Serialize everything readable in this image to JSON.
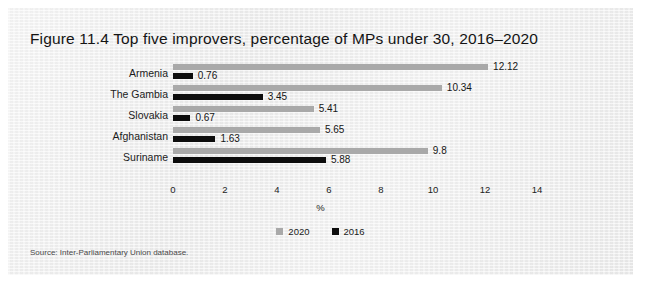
{
  "figure": {
    "title": "Figure 11.4  Top five improvers, percentage of MPs under 30, 2016–2020",
    "source": "Source: Inter-Parliamentary Union database."
  },
  "legend": {
    "items": [
      {
        "label": "2020",
        "color": "#a9a9a9"
      },
      {
        "label": "2016",
        "color": "#0d0d0d"
      }
    ]
  },
  "chart_data": {
    "type": "bar",
    "orientation": "horizontal",
    "title": "Figure 11.4  Top five improvers, percentage of MPs under 30, 2016–2020",
    "categories": [
      "Armenia",
      "The Gambia",
      "Slovakia",
      "Afghanistan",
      "Suriname"
    ],
    "series": [
      {
        "name": "2020",
        "color": "#a9a9a9",
        "values": [
          12.12,
          10.34,
          5.41,
          5.65,
          9.8
        ]
      },
      {
        "name": "2016",
        "color": "#0d0d0d",
        "values": [
          0.76,
          3.45,
          0.67,
          1.63,
          5.88
        ]
      }
    ],
    "value_labels": {
      "2020": [
        "12.12",
        "10.34",
        "5.41",
        "5.65",
        "9.8"
      ],
      "2016": [
        "0.76",
        "3.45",
        "0.67",
        "1.63",
        "5.88"
      ]
    },
    "xlabel": "%",
    "ylabel": "",
    "xlim": [
      0,
      14
    ],
    "xticks": [
      0,
      2,
      4,
      6,
      8,
      10,
      12,
      14
    ],
    "xtick_labels": [
      "0",
      "2",
      "4",
      "6",
      "8",
      "10",
      "12",
      "14"
    ],
    "grid": false,
    "legend_position": "bottom"
  }
}
